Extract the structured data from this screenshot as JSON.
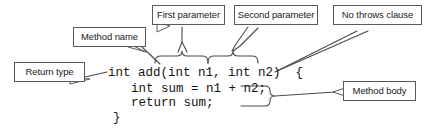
{
  "figure": {
    "background_color": "#ffffff",
    "line_color": "#4a4a4a",
    "box_border_color": "#5a5a5a",
    "text_color": "#1a1a1a"
  },
  "callouts": {
    "return_type": "Return type",
    "method_name": "Method name",
    "first_parameter": "First parameter",
    "second_parameter": "Second parameter",
    "no_throws_clause": "No throws clause",
    "method_body": "Method body"
  },
  "code": {
    "line1": "int add(int n1, int n2)  {",
    "line2": "int sum = n1 + n2;",
    "line3": "return sum;",
    "line4": "}"
  }
}
